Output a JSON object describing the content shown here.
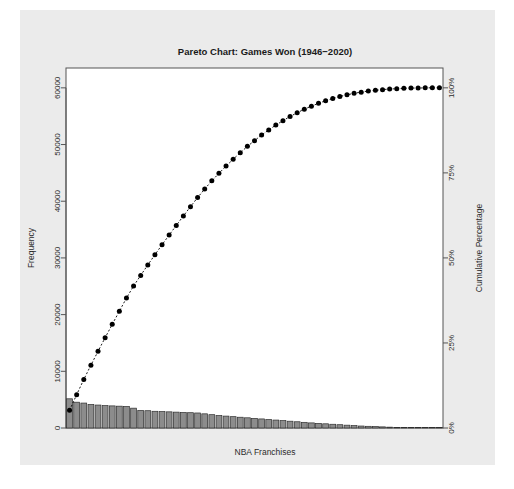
{
  "figure": {
    "background_color": "#ebebeb",
    "page_color": "#ffffff",
    "plot_background": "#ffffff",
    "frame_color": "#555555"
  },
  "chart_data": {
    "type": "bar",
    "title": "Pareto Chart: Games Won (1946−2020)",
    "xlabel": "NBA Franchises",
    "ylabel": "Frequency",
    "y2label": "Cumulative Percentage",
    "grid": false,
    "legend": null,
    "ylim": [
      0,
      63500
    ],
    "y2lim": [
      0,
      100
    ],
    "yticks": [
      0,
      10000,
      20000,
      30000,
      40000,
      50000,
      60000
    ],
    "ytick_labels": [
      "0",
      "10000",
      "20000",
      "30000",
      "40000",
      "50000",
      "60000"
    ],
    "y2ticks": [
      0,
      25,
      50,
      75,
      100
    ],
    "y2tick_labels": [
      "0%",
      "25%",
      "50%",
      "75%",
      "100%"
    ],
    "xtick_labels": [],
    "bar_color": "#8c8c8c",
    "bar_edge_color": "#2e2e2e",
    "line_color": "#000000",
    "marker": "circle",
    "marker_color": "#000000",
    "line_style": "dashed",
    "categories": [
      "C1",
      "C2",
      "C3",
      "C4",
      "C5",
      "C6",
      "C7",
      "C8",
      "C9",
      "C10",
      "C11",
      "C12",
      "C13",
      "C14",
      "C15",
      "C16",
      "C17",
      "C18",
      "C19",
      "C20",
      "C21",
      "C22",
      "C23",
      "C24",
      "C25",
      "C26",
      "C27",
      "C28",
      "C29",
      "C30",
      "C31",
      "C32",
      "C33",
      "C34",
      "C35",
      "C36",
      "C37",
      "C38",
      "C39",
      "C40",
      "C41",
      "C42",
      "C43",
      "C44",
      "C45",
      "C46",
      "C47",
      "C48",
      "C49",
      "C50",
      "C51",
      "C52",
      "C53"
    ],
    "values": [
      5150,
      4550,
      4400,
      4150,
      4050,
      3950,
      3900,
      3850,
      3800,
      3500,
      3100,
      3050,
      2950,
      2900,
      2850,
      2800,
      2750,
      2700,
      2650,
      2500,
      2350,
      2200,
      2100,
      2000,
      1900,
      1800,
      1700,
      1600,
      1500,
      1400,
      1300,
      1200,
      1100,
      1000,
      900,
      820,
      740,
      660,
      580,
      500,
      420,
      350,
      300,
      250,
      200,
      150,
      110,
      80,
      60,
      40,
      25,
      15,
      8
    ],
    "cumulative_percentage": [
      7.8,
      14.7,
      21.4,
      27.7,
      33.8,
      39.8,
      45.7,
      51.5,
      57.3,
      62.6,
      67.3,
      71.9,
      76.4,
      80.8,
      85.1,
      89.3,
      93.5,
      97.6,
      101.6,
      105.4,
      109.0,
      112.3,
      115.5,
      118.5,
      121.4,
      124.2,
      126.7,
      129.2,
      131.4,
      133.6,
      135.5,
      137.4,
      139.0,
      140.6,
      141.9,
      143.2,
      144.3,
      145.3,
      146.2,
      146.9,
      147.6,
      148.1,
      148.6,
      148.9,
      149.2,
      149.5,
      149.6,
      149.8,
      149.9,
      149.9,
      150.0,
      150.0,
      150.0
    ]
  }
}
